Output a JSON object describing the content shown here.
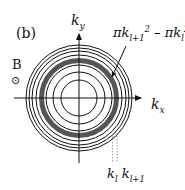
{
  "figure": {
    "panel_label": "(b)",
    "field_label": "B",
    "field_symbol": "⊙",
    "axes": {
      "x_label": "k",
      "x_sub": "x",
      "y_label": "k",
      "y_sub": "y"
    },
    "annotation": {
      "text_parts": [
        "πk",
        "l+1",
        "2",
        " – πk",
        "l",
        "2"
      ],
      "description": "πk_{l+1}^2 – πk_l^2"
    },
    "radius_labels": {
      "k1": "k",
      "k1_sub": "l",
      "k2": "k",
      "k2_sub": "l+1"
    },
    "geometry": {
      "center": [
        79,
        98
      ],
      "circle_radii": [
        18,
        26,
        33,
        43,
        47,
        50,
        53
      ],
      "band_inner_radius": 35,
      "band_outer_radius": 40,
      "band_color": "#555555",
      "line_color": "#111111"
    }
  }
}
